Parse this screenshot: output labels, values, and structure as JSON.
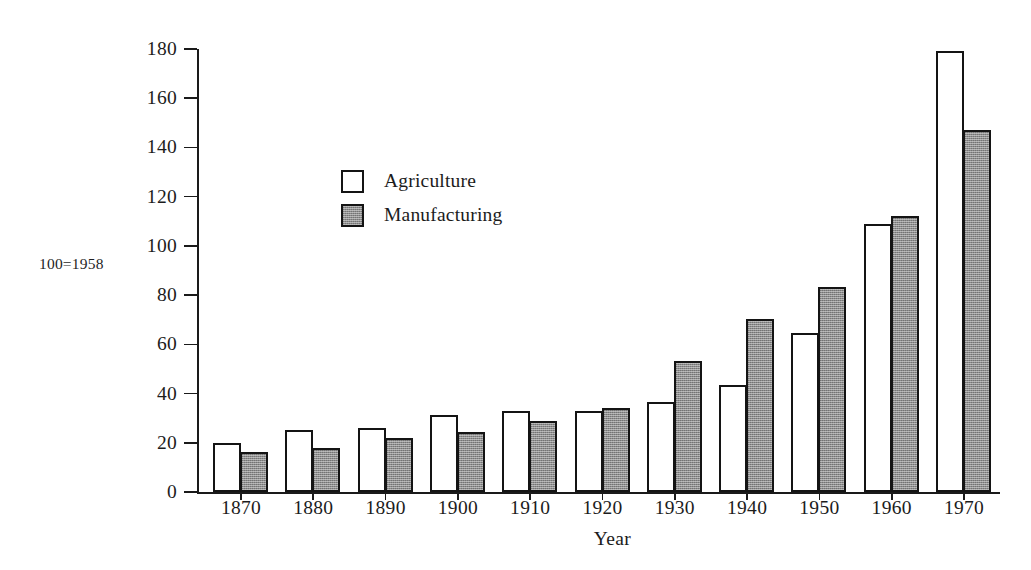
{
  "chart_data": {
    "type": "bar",
    "title": "",
    "xlabel": "Year",
    "ylabel": "",
    "base_note": "100=1958",
    "categories": [
      "1870",
      "1880",
      "1890",
      "1900",
      "1910",
      "1920",
      "1930",
      "1940",
      "1950",
      "1960",
      "1970"
    ],
    "series": [
      {
        "name": "Agriculture",
        "fill": "#ffffff",
        "values": [
          19.8,
          25.0,
          26.0,
          31.3,
          32.8,
          33.0,
          36.5,
          43.5,
          64.5,
          109.0,
          179.0
        ]
      },
      {
        "name": "Manufacturing",
        "fill": "#8d8d8d",
        "values": [
          16.3,
          18.0,
          22.0,
          24.3,
          28.7,
          34.0,
          53.2,
          70.5,
          83.2,
          112.3,
          147.0
        ]
      }
    ],
    "ylim": [
      0,
      180
    ],
    "yticks": [
      0,
      20,
      40,
      60,
      80,
      100,
      120,
      140,
      160,
      180
    ],
    "ytick_labels": [
      "0",
      "20",
      "40",
      "60",
      "80",
      "100",
      "120",
      "140",
      "160",
      "180"
    ],
    "grid": false,
    "legend_position": "upper-left-inside"
  },
  "legend": {
    "items": [
      {
        "label": "Agriculture"
      },
      {
        "label": "Manufacturing"
      }
    ]
  },
  "axes": {
    "x_title": "Year",
    "base_note": "100=1958"
  }
}
